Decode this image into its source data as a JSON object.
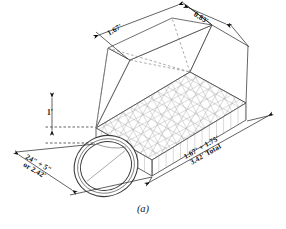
{
  "figure": {
    "caption": "(a)",
    "type": "isometric-engineering-drawing"
  },
  "colors": {
    "line": "#3a3a3a",
    "mesh": "#9a9a9a",
    "hidden": "#8d8d8d",
    "text": "#111111",
    "background": "#ffffff"
  },
  "dimensions": {
    "top_left_slope": {
      "label": "1.67'",
      "name": "top-left-slope-dimension"
    },
    "top_right_slope": {
      "label": "0.83'",
      "name": "top-right-slope-dimension"
    },
    "vertical_height": {
      "label": "1'",
      "name": "vertical-height-dimension"
    },
    "front_width": {
      "line1": "24\" + 5\"",
      "line2": "or 2.42'",
      "name": "front-width-dimension"
    },
    "length": {
      "line1": "1.67' + 1.75'",
      "line2": "3.42' Total",
      "name": "length-dimension"
    }
  }
}
